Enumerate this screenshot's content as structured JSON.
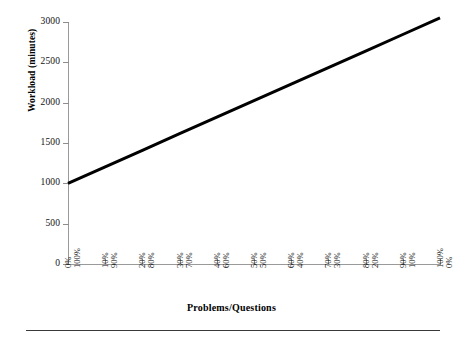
{
  "chart_data": {
    "type": "line",
    "title": "",
    "xlabel": "Problems/Questions",
    "ylabel": "Workload (minutes)",
    "ylim": [
      0,
      3000
    ],
    "yticks": [
      0,
      500,
      1000,
      1500,
      2000,
      2500,
      3000
    ],
    "ytick_labels": [
      "0",
      "500",
      "1000",
      "1500",
      "2000",
      "2500",
      "3000"
    ],
    "grid": false,
    "legend": null,
    "x_axis_note": "dual tick labels: upper row ascending percent, lower row descending percent",
    "xtick_labels_top": [
      "0%",
      "10%",
      "20%",
      "30%",
      "40%",
      "50%",
      "60%",
      "70%",
      "80%",
      "90%",
      "100%"
    ],
    "xtick_labels_bottom": [
      "100%",
      "90%",
      "80%",
      "70%",
      "60%",
      "50%",
      "40%",
      "30%",
      "20%",
      "10%",
      "0%"
    ],
    "x": [
      0,
      1,
      2,
      3,
      4,
      5,
      6,
      7,
      8,
      9,
      10
    ],
    "series": [
      {
        "name": "Workload",
        "values": [
          1000,
          1205,
          1410,
          1615,
          1820,
          2025,
          2230,
          2435,
          2640,
          2845,
          3050
        ],
        "color": "#000000",
        "line_width": 3
      }
    ]
  },
  "style": {
    "axis_color": "#9a9a9a",
    "text_color": "#111111",
    "rule_color": "#3a3a3a",
    "background": "#ffffff"
  }
}
